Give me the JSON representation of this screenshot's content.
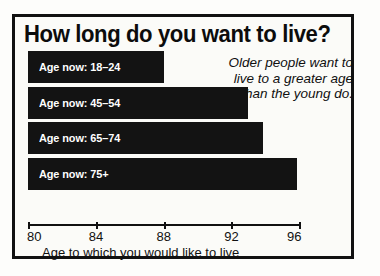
{
  "card": {
    "title": "How long do you want to live?",
    "annotation": "Older people want to live to a greater age than the young do."
  },
  "axis": {
    "title": "Age to which you would like to live",
    "ticks": [
      {
        "label": "80",
        "value": 80
      },
      {
        "label": "84",
        "value": 84
      },
      {
        "label": "88",
        "value": 88
      },
      {
        "label": "92",
        "value": 92
      },
      {
        "label": "96",
        "value": 96
      }
    ]
  },
  "bars": [
    {
      "label": "Age now: 18–24",
      "value": 88.0
    },
    {
      "label": "Age now: 45–54",
      "value": 93.0
    },
    {
      "label": "Age now: 65–74",
      "value": 93.9
    },
    {
      "label": "Age now: 75+",
      "value": 95.9
    }
  ],
  "colors": {
    "bar": "#131313",
    "border": "#111111",
    "background": "#fbfbf8",
    "bar_text": "#fefefe"
  },
  "chart_data": {
    "type": "bar",
    "orientation": "horizontal",
    "title": "How long do you want to live?",
    "xlabel": "Age to which you would like to live",
    "ylabel": "",
    "categories": [
      "Age now: 18–24",
      "Age now: 45–54",
      "Age now: 65–74",
      "Age now: 75+"
    ],
    "values": [
      88.0,
      93.0,
      93.9,
      95.9
    ],
    "xlim": [
      80,
      96
    ],
    "xticks": [
      80,
      84,
      88,
      92,
      96
    ],
    "grid": false,
    "legend": "none",
    "annotations": [
      "Older people want to live to a greater age than the young do."
    ]
  }
}
